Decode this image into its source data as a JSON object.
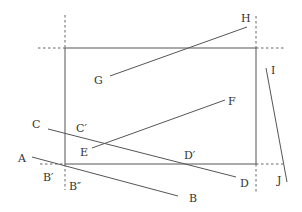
{
  "colors": {
    "line": "#555555",
    "dashed": "#666666",
    "text": "#333333",
    "background": "#ffffff"
  },
  "rectangle": {
    "x": 65,
    "y": 48,
    "width": 191,
    "height": 116
  },
  "extensions": [
    {
      "name": "top-left-vertical",
      "x1": 65,
      "y1": 15,
      "x2": 65,
      "y2": 48
    },
    {
      "name": "top-left-horizontal",
      "x1": 38,
      "y1": 48,
      "x2": 65,
      "y2": 48
    },
    {
      "name": "top-right-vertical",
      "x1": 256,
      "y1": 16,
      "x2": 256,
      "y2": 48
    },
    {
      "name": "top-right-horizontal",
      "x1": 256,
      "y1": 48,
      "x2": 285,
      "y2": 48
    },
    {
      "name": "bottom-left-horizontal",
      "x1": 40,
      "y1": 164,
      "x2": 65,
      "y2": 164
    },
    {
      "name": "bottom-left-vertical",
      "x1": 65,
      "y1": 164,
      "x2": 65,
      "y2": 190
    },
    {
      "name": "bottom-right-horizontal",
      "x1": 256,
      "y1": 164,
      "x2": 283,
      "y2": 164
    },
    {
      "name": "bottom-right-vertical",
      "x1": 256,
      "y1": 164,
      "x2": 256,
      "y2": 192
    }
  ],
  "segments": [
    {
      "name": "segment-ab",
      "x1": 32,
      "y1": 157,
      "x2": 178,
      "y2": 196
    },
    {
      "name": "segment-cd",
      "x1": 48,
      "y1": 129,
      "x2": 236,
      "y2": 177
    },
    {
      "name": "segment-ef",
      "x1": 92,
      "y1": 148,
      "x2": 225,
      "y2": 100
    },
    {
      "name": "segment-gh",
      "x1": 110,
      "y1": 76,
      "x2": 247,
      "y2": 27
    },
    {
      "name": "segment-ij",
      "x1": 266,
      "y1": 68,
      "x2": 287,
      "y2": 182
    }
  ],
  "labels": {
    "A": {
      "text": "A",
      "x": 18,
      "y": 162
    },
    "Bp": {
      "text": "B′",
      "x": 43,
      "y": 181
    },
    "Bpp": {
      "text": "B″",
      "x": 69,
      "y": 190
    },
    "B": {
      "text": "B",
      "x": 189,
      "y": 202
    },
    "C": {
      "text": "C",
      "x": 32,
      "y": 128
    },
    "Cp": {
      "text": "C′",
      "x": 76,
      "y": 132
    },
    "D": {
      "text": "D",
      "x": 240,
      "y": 187
    },
    "Dp": {
      "text": "D′",
      "x": 184,
      "y": 159
    },
    "E": {
      "text": "E",
      "x": 80,
      "y": 156
    },
    "F": {
      "text": "F",
      "x": 228,
      "y": 105
    },
    "G": {
      "text": "G",
      "x": 94,
      "y": 84
    },
    "H": {
      "text": "H",
      "x": 241,
      "y": 22
    },
    "I": {
      "text": "I",
      "x": 271,
      "y": 74
    },
    "J": {
      "text": "J",
      "x": 277,
      "y": 184
    }
  }
}
